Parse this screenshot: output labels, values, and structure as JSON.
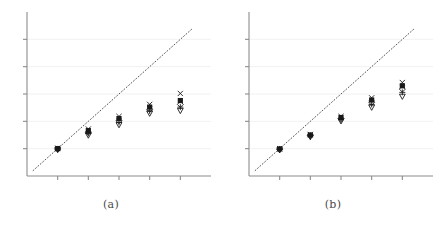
{
  "figure": {
    "width": 444,
    "height": 243,
    "background": "#ffffff",
    "axis_color": "#8c8c8c",
    "grid_color": "#eeeeee",
    "marker_color": "#1a1a1a",
    "refline_color": "#555555",
    "refline_style": "dotted"
  },
  "panels": [
    {
      "id": "a",
      "caption": "(a)"
    },
    {
      "id": "b",
      "caption": "(b)"
    }
  ],
  "chart_data": [
    {
      "type": "scatter",
      "title": "(a)",
      "xlabel": "",
      "ylabel": "",
      "xlim": [
        0,
        6
      ],
      "ylim": [
        0,
        6
      ],
      "grid": true,
      "grid_lines_y": [
        1,
        2,
        3,
        4,
        5
      ],
      "legend": "none",
      "xticks": [
        1,
        2,
        3,
        4,
        5
      ],
      "xtick_labels": [
        "",
        "",
        "",
        "",
        ""
      ],
      "yticks": [
        1,
        2,
        3,
        4,
        5
      ],
      "ytick_labels": [
        "",
        "",
        "",
        "",
        ""
      ],
      "reference_line": {
        "type": "identity",
        "x": [
          0.2,
          5.4
        ],
        "y": [
          0.2,
          5.4
        ],
        "style": "dotted"
      },
      "series": [
        {
          "name": "x-marker",
          "marker": "x",
          "x": [
            1,
            2,
            3,
            4,
            5
          ],
          "y": [
            1.02,
            1.72,
            2.18,
            2.62,
            3.02
          ]
        },
        {
          "name": "filled-square",
          "marker": "square",
          "x": [
            1,
            2,
            3,
            4,
            5
          ],
          "y": [
            1.0,
            1.66,
            2.1,
            2.52,
            2.76
          ]
        },
        {
          "name": "diamond",
          "marker": "diamond",
          "x": [
            1,
            2,
            3,
            4,
            5
          ],
          "y": [
            0.99,
            1.6,
            2.02,
            2.44,
            2.62
          ]
        },
        {
          "name": "plus",
          "marker": "plus",
          "x": [
            1,
            2,
            3,
            4,
            5
          ],
          "y": [
            0.98,
            1.56,
            1.96,
            2.38,
            2.52
          ]
        },
        {
          "name": "down-triangle",
          "marker": "triangle-down",
          "x": [
            1,
            2,
            3,
            4,
            5
          ],
          "y": [
            0.97,
            1.5,
            1.88,
            2.3,
            2.4
          ]
        }
      ]
    },
    {
      "type": "scatter",
      "title": "(b)",
      "xlabel": "",
      "ylabel": "",
      "xlim": [
        0,
        6
      ],
      "ylim": [
        0,
        6
      ],
      "grid": true,
      "grid_lines_y": [
        1,
        2,
        3,
        4,
        5
      ],
      "legend": "none",
      "xticks": [
        1,
        2,
        3,
        4,
        5
      ],
      "xtick_labels": [
        "",
        "",
        "",
        "",
        ""
      ],
      "yticks": [
        1,
        2,
        3,
        4,
        5
      ],
      "ytick_labels": [
        "",
        "",
        "",
        "",
        ""
      ],
      "reference_line": {
        "type": "identity",
        "x": [
          0.2,
          5.4
        ],
        "y": [
          0.2,
          5.4
        ],
        "style": "dotted"
      },
      "series": [
        {
          "name": "x-marker",
          "marker": "x",
          "x": [
            1,
            2,
            3,
            4,
            5
          ],
          "y": [
            1.0,
            1.52,
            2.18,
            2.86,
            3.42
          ]
        },
        {
          "name": "filled-square",
          "marker": "square",
          "x": [
            1,
            2,
            3,
            4,
            5
          ],
          "y": [
            0.99,
            1.5,
            2.14,
            2.78,
            3.3
          ]
        },
        {
          "name": "diamond",
          "marker": "diamond",
          "x": [
            1,
            2,
            3,
            4,
            5
          ],
          "y": [
            0.98,
            1.48,
            2.1,
            2.7,
            3.18
          ]
        },
        {
          "name": "plus",
          "marker": "plus",
          "x": [
            1,
            2,
            3,
            4,
            5
          ],
          "y": [
            0.97,
            1.46,
            2.06,
            2.62,
            3.06
          ]
        },
        {
          "name": "down-triangle",
          "marker": "triangle-down",
          "x": [
            1,
            2,
            3,
            4,
            5
          ],
          "y": [
            0.96,
            1.44,
            2.02,
            2.52,
            2.92
          ]
        }
      ]
    }
  ]
}
